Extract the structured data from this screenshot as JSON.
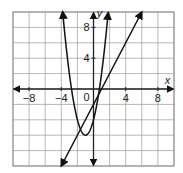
{
  "chart_data": {
    "type": "line",
    "title": "",
    "xlabel": "x",
    "ylabel": "y",
    "xlim": [
      -10,
      10
    ],
    "ylim": [
      -10,
      10
    ],
    "grid": true,
    "grid_step": 2,
    "x_ticks": [
      -8,
      -4,
      0,
      4,
      8
    ],
    "x_tick_labels": [
      "−8",
      "−4",
      "0",
      "4",
      "8"
    ],
    "y_ticks": [
      4,
      8
    ],
    "y_tick_labels": [
      "4",
      "8"
    ],
    "origin_label": "0",
    "series": [
      {
        "name": "parabola",
        "kind": "quadratic",
        "equation_estimate": "y = 2x^2 + 4x - 4",
        "coefficients": [
          2,
          4,
          -4
        ],
        "vertex": [
          -1,
          -6
        ],
        "x_range": [
          -3.83,
          1.83
        ],
        "arrows": "both",
        "color": "#111111"
      },
      {
        "name": "line",
        "kind": "linear",
        "equation_estimate": "y = 2x - 2",
        "slope": 2,
        "intercept": -2,
        "x_range": [
          -4,
          6
        ],
        "arrows": "both",
        "color": "#111111"
      }
    ]
  },
  "colors": {
    "grid": "#9a9a9a",
    "axis": "#222222",
    "curve": "#111111",
    "background": "#ffffff"
  }
}
